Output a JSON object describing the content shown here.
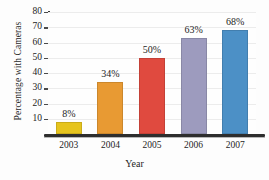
{
  "chart_data": {
    "type": "bar",
    "title": "",
    "xlabel": "Year",
    "ylabel": "Percentage with Cameras",
    "categories": [
      "2003",
      "2004",
      "2005",
      "2006",
      "2007"
    ],
    "values": [
      8,
      34,
      50,
      63,
      68
    ],
    "data_labels": [
      "8%",
      "34%",
      "50%",
      "63%",
      "68%"
    ],
    "bar_colors": [
      "#E6C41E",
      "#E89A33",
      "#E04A3F",
      "#9D9BBE",
      "#4C90C6"
    ],
    "ylim": [
      0,
      80
    ],
    "yticks": [
      10,
      20,
      30,
      40,
      50,
      60,
      70,
      80
    ],
    "ytick_labels": [
      "10",
      "20",
      "30",
      "40",
      "50",
      "60",
      "70",
      "80"
    ],
    "grid": true,
    "legend": "none"
  },
  "axis": {
    "axis_color": "#2e2e2e",
    "grid_color": "#ececec"
  }
}
